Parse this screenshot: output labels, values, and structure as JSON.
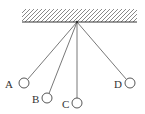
{
  "diagram": {
    "ceiling": {
      "icon": "hatched-ceiling"
    },
    "pendulums": [
      {
        "label": "A"
      },
      {
        "label": "B"
      },
      {
        "label": "C"
      },
      {
        "label": "D"
      }
    ],
    "colors": {
      "stroke": "#555555",
      "text": "#333333",
      "background": "#ffffff"
    }
  }
}
